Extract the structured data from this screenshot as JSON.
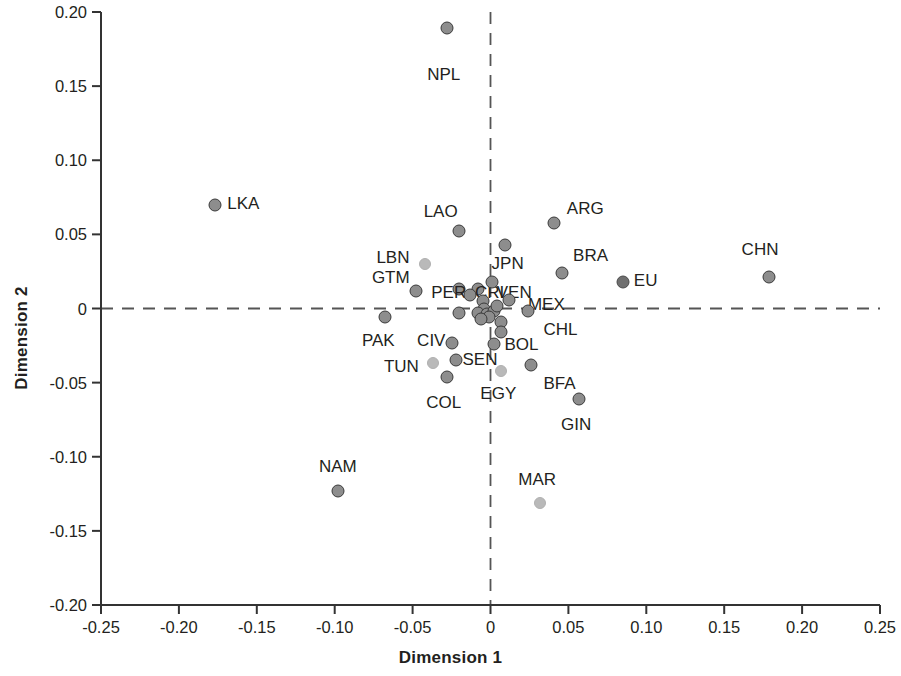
{
  "chart_data": {
    "type": "scatter",
    "title": "",
    "xlabel": "Dimension 1",
    "ylabel": "Dimension 2",
    "xlim": [
      -0.25,
      0.25
    ],
    "ylim": [
      -0.2,
      0.2
    ],
    "xticks": [
      "-0.25",
      "-0.20",
      "-0.15",
      "-0.10",
      "-0.05",
      "0",
      "0.05",
      "0.10",
      "0.15",
      "0.20",
      "0.25"
    ],
    "xtick_values": [
      -0.25,
      -0.2,
      -0.15,
      -0.1,
      -0.05,
      0,
      0.05,
      0.1,
      0.15,
      0.2,
      0.25
    ],
    "yticks": [
      "0.20",
      "0.15",
      "0.10",
      "0.05",
      "0",
      "-0.05",
      "-0.10",
      "-0.15",
      "-0.20"
    ],
    "ytick_values": [
      0.2,
      0.15,
      0.1,
      0.05,
      0,
      -0.05,
      -0.1,
      -0.15,
      -0.2
    ],
    "grid": false,
    "legend": "none",
    "reference_lines": [
      {
        "axis": "x",
        "value": 0,
        "style": "dashed"
      },
      {
        "axis": "y",
        "value": 0,
        "style": "dashed"
      }
    ],
    "marker_colors": {
      "dark": "#8d8d8d",
      "light": "#b9b9b9",
      "solid": "#6f6f6f",
      "edge": "#3a3a3a"
    },
    "points": [
      {
        "label": "NPL",
        "x": -0.028,
        "y": 0.189,
        "style": "dark",
        "lx": -0.03,
        "ly": 0.158,
        "anchor": "middle"
      },
      {
        "label": "LKA",
        "x": -0.177,
        "y": 0.07,
        "style": "dark",
        "lx": -0.169,
        "ly": 0.071,
        "anchor": "start"
      },
      {
        "label": "ARG",
        "x": 0.041,
        "y": 0.058,
        "style": "dark",
        "lx": 0.049,
        "ly": 0.068,
        "anchor": "start"
      },
      {
        "label": "LAO",
        "x": -0.02,
        "y": 0.052,
        "style": "dark",
        "lx": -0.032,
        "ly": 0.066,
        "anchor": "middle"
      },
      {
        "label": "JPN",
        "x": 0.009,
        "y": 0.043,
        "style": "dark",
        "lx": 0.011,
        "ly": 0.031,
        "anchor": "middle"
      },
      {
        "label": "CHN",
        "x": 0.179,
        "y": 0.021,
        "style": "dark",
        "lx": 0.173,
        "ly": 0.04,
        "anchor": "middle"
      },
      {
        "label": "LBN",
        "x": -0.042,
        "y": 0.03,
        "style": "light",
        "lx": -0.052,
        "ly": 0.035,
        "anchor": "end"
      },
      {
        "label": "BRA",
        "x": 0.046,
        "y": 0.024,
        "style": "dark",
        "lx": 0.053,
        "ly": 0.036,
        "anchor": "start"
      },
      {
        "label": "EU",
        "x": 0.085,
        "y": 0.018,
        "style": "solid",
        "lx": 0.092,
        "ly": 0.019,
        "anchor": "start"
      },
      {
        "label": "GTM",
        "x": -0.048,
        "y": 0.012,
        "style": "dark",
        "lx": -0.064,
        "ly": 0.021,
        "anchor": "middle"
      },
      {
        "label": "PER",
        "x": -0.02,
        "y": 0.013,
        "style": "dark",
        "lx": -0.038,
        "ly": 0.011,
        "anchor": "start"
      },
      {
        "label": "CRI",
        "x": -0.008,
        "y": 0.013,
        "style": "dark",
        "lx": -0.01,
        "ly": 0.011,
        "anchor": "start"
      },
      {
        "label": "VEN",
        "x": 0.001,
        "y": 0.018,
        "style": "dark",
        "lx": 0.004,
        "ly": 0.011,
        "anchor": "start"
      },
      {
        "label": "MEX",
        "x": 0.012,
        "y": 0.006,
        "style": "dark",
        "lx": 0.024,
        "ly": 0.003,
        "anchor": "start"
      },
      {
        "label": "CHL",
        "x": 0.024,
        "y": -0.002,
        "style": "dark",
        "lx": 0.034,
        "ly": -0.014,
        "anchor": "start"
      },
      {
        "label": "PAK",
        "x": -0.068,
        "y": -0.006,
        "style": "dark",
        "lx": -0.072,
        "ly": -0.021,
        "anchor": "middle"
      },
      {
        "label": "CIV",
        "x": -0.025,
        "y": -0.023,
        "style": "dark",
        "lx": -0.038,
        "ly": -0.021,
        "anchor": "middle"
      },
      {
        "label": "BOL",
        "x": 0.002,
        "y": -0.024,
        "style": "dark",
        "lx": 0.009,
        "ly": -0.024,
        "anchor": "start"
      },
      {
        "label": "SEN",
        "x": -0.022,
        "y": -0.035,
        "style": "dark",
        "lx": -0.018,
        "ly": -0.034,
        "anchor": "start"
      },
      {
        "label": "TUN",
        "x": -0.037,
        "y": -0.037,
        "style": "light",
        "lx": -0.046,
        "ly": -0.039,
        "anchor": "end"
      },
      {
        "label": "BFA",
        "x": 0.026,
        "y": -0.038,
        "style": "dark",
        "lx": 0.034,
        "ly": -0.05,
        "anchor": "start"
      },
      {
        "label": "COL",
        "x": -0.028,
        "y": -0.046,
        "style": "dark",
        "lx": -0.03,
        "ly": -0.063,
        "anchor": "middle"
      },
      {
        "label": "EGY",
        "x": 0.007,
        "y": -0.042,
        "style": "light",
        "lx": 0.005,
        "ly": -0.057,
        "anchor": "middle"
      },
      {
        "label": "GIN",
        "x": 0.057,
        "y": -0.061,
        "style": "dark",
        "lx": 0.055,
        "ly": -0.078,
        "anchor": "middle"
      },
      {
        "label": "NAM",
        "x": -0.098,
        "y": -0.123,
        "style": "dark",
        "lx": -0.098,
        "ly": -0.106,
        "anchor": "middle"
      },
      {
        "label": "MAR",
        "x": 0.032,
        "y": -0.131,
        "style": "light",
        "lx": 0.03,
        "ly": -0.115,
        "anchor": "middle"
      },
      {
        "label": "",
        "x": -0.013,
        "y": 0.009,
        "style": "dark"
      },
      {
        "label": "",
        "x": -0.005,
        "y": 0.005,
        "style": "dark"
      },
      {
        "label": "",
        "x": -0.004,
        "y": 0.0,
        "style": "dark"
      },
      {
        "label": "",
        "x": -0.008,
        "y": -0.003,
        "style": "dark"
      },
      {
        "label": "",
        "x": -0.002,
        "y": -0.004,
        "style": "dark"
      },
      {
        "label": "",
        "x": 0.002,
        "y": -0.002,
        "style": "dark"
      },
      {
        "label": "",
        "x": 0.004,
        "y": 0.002,
        "style": "dark"
      },
      {
        "label": "",
        "x": -0.02,
        "y": -0.003,
        "style": "dark"
      },
      {
        "label": "",
        "x": 0.007,
        "y": -0.009,
        "style": "dark"
      },
      {
        "label": "",
        "x": 0.007,
        "y": -0.016,
        "style": "dark"
      },
      {
        "label": "",
        "x": -0.001,
        "y": -0.006,
        "style": "dark"
      },
      {
        "label": "",
        "x": -0.006,
        "y": -0.007,
        "style": "dark"
      }
    ]
  },
  "axes": {
    "x_title": "Dimension 1",
    "y_title": "Dimension 2"
  }
}
